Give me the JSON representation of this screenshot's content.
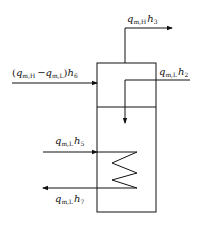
{
  "diagram": {
    "type": "heat-exchanger-flow-diagram",
    "labels": {
      "top_outlet": {
        "var": "q",
        "sub": "m,H",
        "h": "h",
        "hsub": "3"
      },
      "left_inlet": {
        "prefix": "(",
        "var1": "q",
        "sub1": "m,H",
        "minus": "−",
        "var2": "q",
        "sub2": "m,L",
        "suffix": ")",
        "h": "h",
        "hsub": "6"
      },
      "right_inlet": {
        "var": "q",
        "sub": "m,L",
        "h": "h",
        "hsub": "2"
      },
      "coil_inlet": {
        "var": "q",
        "sub": "m,L",
        "h": "h",
        "hsub": "5"
      },
      "coil_outlet": {
        "var": "q",
        "sub": "m,L",
        "h": "h",
        "hsub": "7"
      }
    },
    "colors": {
      "stroke": "#111111",
      "background": "#ffffff"
    }
  }
}
